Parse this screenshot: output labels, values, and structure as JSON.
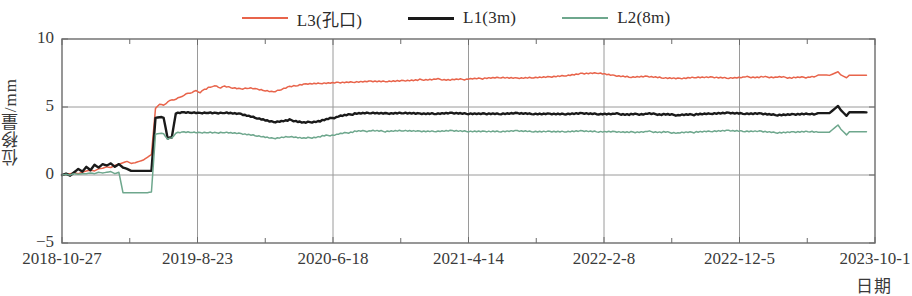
{
  "chart_data": {
    "type": "line",
    "title": "",
    "xlabel": "日期",
    "ylabel": "位移量/mm",
    "ylim": [
      -5,
      10
    ],
    "yticks": [
      10,
      5,
      0,
      -5
    ],
    "xticks": [
      "2018-10-27",
      "2019-8-23",
      "2020-6-18",
      "2021-4-14",
      "2022-2-8",
      "2022-12-5",
      "2023-10-1"
    ],
    "xlim_labels": [
      "2018-10-27",
      "2023-10-1"
    ],
    "grid": true,
    "legend_position": "top-center",
    "colors": {
      "L3": "#e8644b",
      "L1": "#1a1a1a",
      "L2": "#6ea78d",
      "grid": "#9a9a9a",
      "axis": "#6b6b6b"
    },
    "series": [
      {
        "name": "L3(孔口)",
        "color": "#e8644b",
        "x": [
          0.0,
          0.5,
          1.0,
          1.5,
          2.0,
          2.5,
          3.0,
          3.5,
          4.0,
          4.5,
          5.0,
          5.5,
          6.0,
          6.5,
          7.0,
          7.5,
          8.0,
          8.5,
          9.0,
          9.5,
          10.0,
          10.5,
          11.0,
          11.5,
          12.0,
          12.5,
          13.0,
          13.5,
          14.0,
          14.5,
          15.0,
          15.5,
          16.0,
          16.5,
          17.0,
          17.5,
          18.0,
          18.5,
          19.0,
          19.5,
          20.0,
          21.0,
          22.0,
          23.0,
          24.0,
          25.0,
          26.0,
          27.0,
          28.0,
          29.0,
          30.0,
          32.0,
          34.0,
          36.0,
          38.0,
          40.0,
          42.0,
          44.0,
          46.0,
          48.0,
          50.0,
          52.0,
          54.0,
          56.0,
          58.0,
          60.0,
          62.0,
          64.0,
          66.0,
          68.0,
          70.0,
          72.0,
          74.0,
          76.0,
          78.0,
          80.0,
          82.0,
          84.0,
          86.0,
          88.0,
          90.0,
          92.0,
          94.0,
          96.0,
          98.0,
          100.0
        ],
        "y": [
          0.0,
          0.05,
          0.1,
          0.15,
          0.1,
          0.2,
          0.3,
          0.35,
          0.3,
          0.45,
          0.5,
          0.6,
          0.55,
          0.7,
          0.8,
          0.9,
          1.0,
          0.85,
          0.9,
          1.0,
          1.1,
          1.3,
          1.5,
          4.9,
          5.2,
          5.1,
          5.4,
          5.5,
          5.6,
          5.7,
          5.9,
          6.0,
          6.1,
          6.2,
          6.1,
          6.3,
          6.4,
          6.5,
          6.5,
          6.4,
          6.5,
          6.4,
          6.3,
          6.4,
          6.3,
          6.2,
          6.1,
          6.3,
          6.5,
          6.6,
          6.7,
          6.75,
          6.8,
          6.85,
          6.9,
          6.9,
          6.95,
          7.0,
          7.05,
          7.0,
          7.05,
          7.1,
          7.15,
          7.1,
          7.15,
          7.2,
          7.3,
          7.45,
          7.5,
          7.3,
          7.2,
          7.25,
          7.15,
          7.1,
          7.2,
          7.2,
          7.15,
          7.2,
          7.2,
          7.2,
          7.15,
          7.2,
          7.25,
          7.2,
          7.3,
          7.3
        ],
        "y_final_bump": {
          "x": 95.5,
          "y": 7.6
        },
        "y_last": 7.35
      },
      {
        "name": "L1(3m)",
        "color": "#1a1a1a",
        "x": [
          0.0,
          0.5,
          1.0,
          1.5,
          2.0,
          2.5,
          3.0,
          3.5,
          4.0,
          4.5,
          5.0,
          5.5,
          6.0,
          6.5,
          7.0,
          7.5,
          8.0,
          8.5,
          9.0,
          9.5,
          10.0,
          10.5,
          11.0,
          11.5,
          12.0,
          12.5,
          13.0,
          13.5,
          14.0,
          15.0,
          16.0,
          17.0,
          18.0,
          19.0,
          20.0,
          22.0,
          24.0,
          26.0,
          28.0,
          30.0,
          32.0,
          34.0,
          36.0,
          38.0,
          40.0,
          42.0,
          44.0,
          46.0,
          48.0,
          50.0,
          52.0,
          54.0,
          56.0,
          58.0,
          60.0,
          62.0,
          64.0,
          66.0,
          68.0,
          70.0,
          72.0,
          74.0,
          76.0,
          78.0,
          80.0,
          82.0,
          84.0,
          86.0,
          88.0,
          90.0,
          92.0,
          94.0,
          96.0,
          98.0,
          100.0
        ],
        "y": [
          0.0,
          0.1,
          -0.05,
          0.2,
          0.45,
          0.25,
          0.6,
          0.35,
          0.75,
          0.55,
          0.8,
          0.7,
          0.85,
          0.6,
          0.8,
          0.55,
          0.45,
          0.3,
          0.3,
          0.3,
          0.3,
          0.3,
          0.3,
          4.2,
          4.25,
          4.2,
          2.7,
          2.75,
          4.55,
          4.6,
          4.6,
          4.55,
          4.6,
          4.55,
          4.6,
          4.5,
          4.2,
          3.9,
          4.05,
          3.85,
          4.0,
          4.3,
          4.5,
          4.55,
          4.5,
          4.55,
          4.5,
          4.5,
          4.55,
          4.5,
          4.5,
          4.5,
          4.55,
          4.5,
          4.5,
          4.5,
          4.55,
          4.5,
          4.5,
          4.45,
          4.5,
          4.45,
          4.4,
          4.45,
          4.5,
          4.55,
          4.5,
          4.5,
          4.4,
          4.45,
          4.5,
          4.4,
          4.45,
          4.5,
          4.5
        ],
        "y_final_bump": {
          "x": 95.5,
          "y": 5.1
        },
        "y_last": 4.6
      },
      {
        "name": "L2(8m)",
        "color": "#6ea78d",
        "x": [
          0.0,
          0.5,
          1.0,
          1.5,
          2.0,
          2.5,
          3.0,
          3.5,
          4.0,
          4.5,
          5.0,
          5.5,
          6.0,
          6.5,
          7.0,
          7.5,
          8.0,
          8.5,
          9.0,
          9.5,
          10.0,
          10.5,
          11.0,
          11.5,
          12.0,
          12.5,
          13.0,
          13.5,
          14.0,
          15.0,
          16.0,
          17.0,
          18.0,
          19.0,
          20.0,
          22.0,
          24.0,
          26.0,
          28.0,
          30.0,
          32.0,
          34.0,
          36.0,
          38.0,
          40.0,
          42.0,
          44.0,
          46.0,
          48.0,
          50.0,
          52.0,
          54.0,
          56.0,
          58.0,
          60.0,
          62.0,
          64.0,
          66.0,
          68.0,
          70.0,
          72.0,
          74.0,
          76.0,
          78.0,
          80.0,
          82.0,
          84.0,
          86.0,
          88.0,
          90.0,
          92.0,
          94.0,
          96.0,
          98.0,
          100.0
        ],
        "y": [
          0.0,
          0.05,
          0.0,
          0.1,
          0.05,
          0.1,
          0.1,
          0.15,
          0.1,
          0.2,
          0.15,
          0.2,
          0.25,
          0.1,
          0.2,
          -1.3,
          -1.3,
          -1.3,
          -1.3,
          -1.3,
          -1.3,
          -1.3,
          -1.25,
          3.0,
          3.05,
          3.0,
          2.65,
          2.7,
          3.1,
          3.15,
          3.15,
          3.1,
          3.15,
          3.1,
          3.15,
          3.05,
          2.9,
          2.7,
          2.85,
          2.7,
          2.85,
          3.0,
          3.2,
          3.25,
          3.2,
          3.25,
          3.2,
          3.2,
          3.25,
          3.2,
          3.2,
          3.2,
          3.25,
          3.2,
          3.2,
          3.2,
          3.25,
          3.2,
          3.2,
          3.15,
          3.2,
          3.15,
          3.1,
          3.15,
          3.2,
          3.25,
          3.2,
          3.2,
          3.1,
          3.15,
          3.2,
          3.1,
          3.15,
          3.2,
          3.1
        ],
        "y_final_bump": {
          "x": 95.5,
          "y": 3.7
        },
        "y_last": 3.15
      }
    ]
  },
  "legend": {
    "items": [
      {
        "label": "L3(孔口)",
        "color": "#e8644b",
        "width": 2
      },
      {
        "label": "L1(3m)",
        "color": "#1a1a1a",
        "width": 3
      },
      {
        "label": "L2(8m)",
        "color": "#6ea78d",
        "width": 2
      }
    ]
  },
  "axes": {
    "y_title": "位移量/mm",
    "x_title": "日期",
    "y_ticks": [
      "10",
      "5",
      "0",
      "-5"
    ],
    "x_ticks": [
      "2018-10-27",
      "2019-8-23",
      "2020-6-18",
      "2021-4-14",
      "2022-2-8",
      "2022-12-5",
      "2023-10-1"
    ]
  }
}
